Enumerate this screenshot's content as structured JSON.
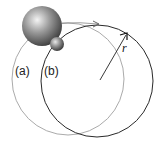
{
  "diagram": {
    "labels": {
      "orbit_a": "(a)",
      "orbit_b": "(b)",
      "radius": "r"
    },
    "colors": {
      "orbit_a": "#9a9a9a",
      "orbit_b": "#2a2a2a",
      "background": "#ffffff"
    }
  }
}
